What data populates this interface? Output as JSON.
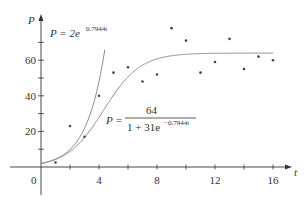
{
  "chart_data": {
    "type": "scatter",
    "title": "",
    "xlabel": "t",
    "ylabel": "P",
    "xlim": [
      0,
      17
    ],
    "ylim": [
      0,
      84
    ],
    "x_ticks": [
      0,
      2,
      4,
      6,
      8,
      10,
      12,
      14,
      16
    ],
    "x_tick_labels": [
      "0",
      "4",
      "8",
      "12",
      "16"
    ],
    "x_tick_label_values": [
      0,
      4,
      8,
      12,
      16
    ],
    "y_ticks": [
      10,
      20,
      30,
      40,
      50,
      60,
      70
    ],
    "y_tick_labels": [
      "20",
      "40",
      "60"
    ],
    "y_tick_label_values": [
      20,
      40,
      60
    ],
    "grid": false,
    "legend": "none",
    "series": [
      {
        "name": "observed data",
        "type": "scatter",
        "x": [
          1,
          2,
          3,
          4,
          5,
          6,
          7,
          8,
          9,
          10,
          11,
          12,
          13,
          14,
          15,
          16
        ],
        "values": [
          2.5,
          23,
          17,
          40,
          53,
          56,
          48,
          52,
          78,
          71,
          53,
          59,
          72,
          55,
          62,
          60
        ]
      },
      {
        "name": "P = 2e^{0.7944t}",
        "type": "line",
        "formula": "2*exp(0.7944*t)",
        "domain": [
          0,
          4.4
        ]
      },
      {
        "name": "P = 64 / (1 + 31e^{-0.7944t})",
        "type": "line",
        "formula": "64/(1+31*exp(-0.7944*t))",
        "domain": [
          0,
          16
        ]
      }
    ],
    "annotations": [
      {
        "text": "P = 2e^{0.7944t}",
        "near": "exponential curve"
      },
      {
        "text": "P = 64 / (1 + 31e^{-0.7944t})",
        "near": "logistic curve"
      }
    ]
  },
  "labels": {
    "y_axis": "P",
    "x_axis": "t",
    "origin": "0",
    "exp_formula_main": "P = 2e",
    "exp_formula_exp": "0.7944t",
    "log_formula_lhs": "P =",
    "log_formula_num": "64",
    "log_formula_den": "1 + 31e",
    "log_formula_den_exp": "−0.7944t"
  },
  "colors": {
    "axis": "#333333",
    "curve": "#8a8a8a",
    "points": "#444444"
  }
}
